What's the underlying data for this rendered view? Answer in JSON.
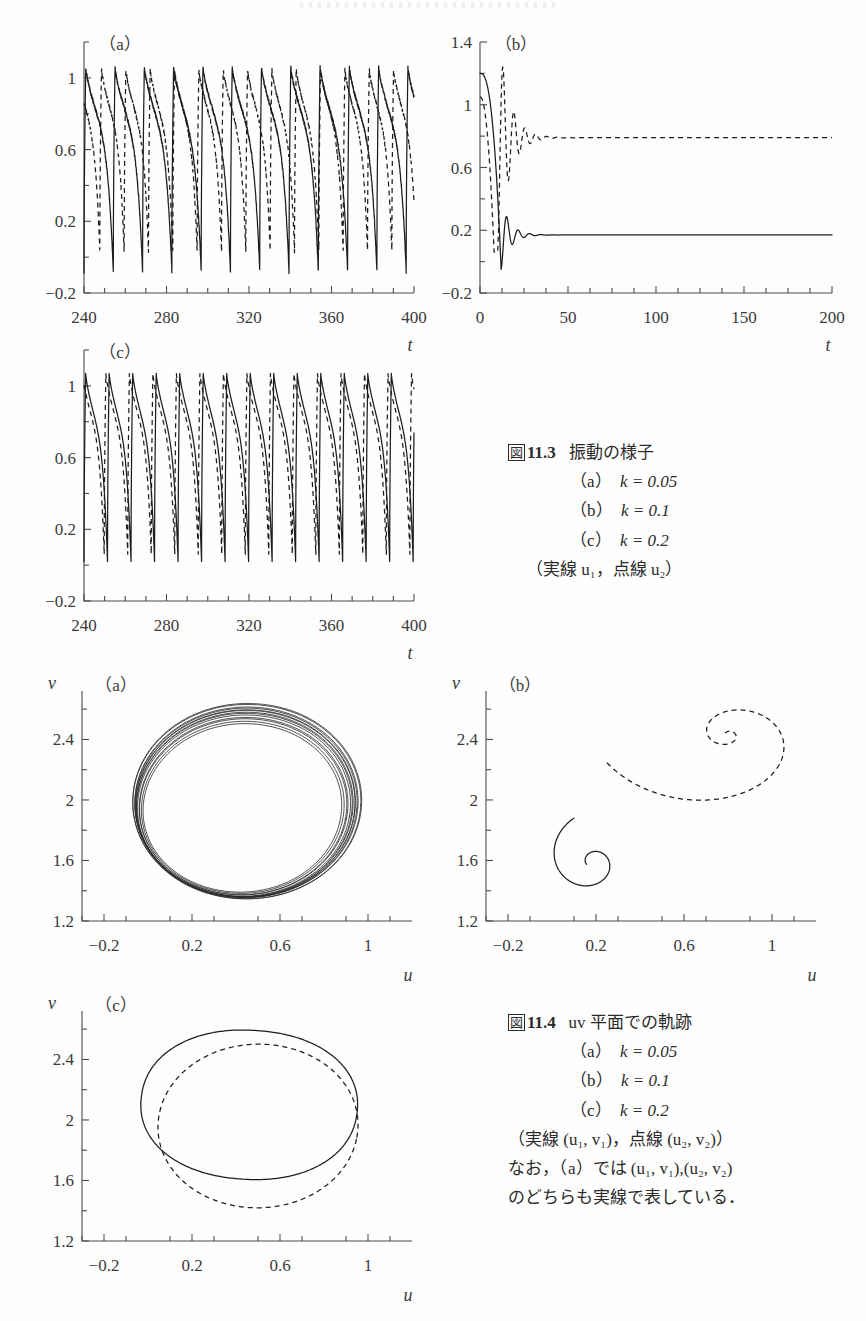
{
  "page": {
    "width": 866,
    "height": 1321,
    "background": "#fefefe",
    "ink": "#1d1d1d"
  },
  "figures": [
    {
      "id": "fig-11-3",
      "caption": {
        "number": "11.3",
        "fig_word": "図",
        "title": "振動の様子",
        "items": [
          {
            "tag": "（a）",
            "text": "k = 0.05"
          },
          {
            "tag": "（b）",
            "text": "k = 0.1"
          },
          {
            "tag": "（c）",
            "text": "k = 0.2"
          }
        ],
        "note": "（実線 u₁，点線 u₂）"
      }
    },
    {
      "id": "fig-11-4",
      "caption": {
        "number": "11.4",
        "fig_word": "図",
        "title": "uv 平面での軌跡",
        "items": [
          {
            "tag": "（a）",
            "text": "k = 0.05"
          },
          {
            "tag": "（b）",
            "text": "k = 0.1"
          },
          {
            "tag": "（c）",
            "text": "k = 0.2"
          }
        ],
        "note": "（実線 (u₁, v₁)，点線 (u₂, v₂)）",
        "note2": "なお，（a）では (u₁, v₁),(u₂, v₂)",
        "note3": "のどちらも実線で表している．"
      }
    }
  ],
  "chart_data": [
    {
      "id": "fig113a",
      "type": "line",
      "panel_tag": "（a）",
      "title": "",
      "xlabel": "t",
      "ylabel": "",
      "xlim": [
        240,
        400
      ],
      "ylim": [
        -0.2,
        1.2
      ],
      "xticks": [
        240,
        280,
        320,
        360,
        400
      ],
      "xtick_labels": [
        "240",
        "280",
        "320",
        "360",
        "400"
      ],
      "yticks": [
        -0.2,
        0.2,
        0.6,
        1.0
      ],
      "ytick_labels": [
        "-0.2",
        "0.2",
        "0.6",
        "1"
      ],
      "minor_x_step": 10,
      "minor_y_step": 0.2,
      "grid": false,
      "legend": false,
      "series": [
        {
          "name": "u1",
          "style": "solid",
          "kind": "relaxation",
          "period": 14.2,
          "phase": 0.0,
          "high": 1.06,
          "low": -0.08,
          "rise_frac": 0.06,
          "jitter": 0.02
        },
        {
          "name": "u2",
          "style": "dashed",
          "kind": "relaxation",
          "period": 11.8,
          "phase": 0.35,
          "high": 1.05,
          "low": 0.03,
          "rise_frac": 0.07,
          "jitter": 0.02
        }
      ]
    },
    {
      "id": "fig113b",
      "type": "line",
      "panel_tag": "（b）",
      "title": "",
      "xlabel": "t",
      "ylabel": "",
      "xlim": [
        0,
        200
      ],
      "ylim": [
        -0.2,
        1.4
      ],
      "xticks": [
        0,
        50,
        100,
        150,
        200
      ],
      "xtick_labels": [
        "0",
        "50",
        "100",
        "150",
        "200"
      ],
      "yticks": [
        -0.2,
        0.2,
        0.6,
        1.0,
        1.4
      ],
      "ytick_labels": [
        "-0.2",
        "0.2",
        "0.6",
        "1",
        "1.4"
      ],
      "minor_x_step": 12.5,
      "minor_y_step": 0.2,
      "grid": false,
      "legend": false,
      "series": [
        {
          "name": "u1",
          "style": "solid",
          "kind": "damped",
          "start": 1.2,
          "settle": 0.17,
          "undershoot": -0.05,
          "t_drop": 12.0,
          "decay": 0.2,
          "osc_period": 6.5
        },
        {
          "name": "u2",
          "style": "dashed",
          "kind": "damped",
          "start": 1.05,
          "settle": 0.79,
          "undershoot": 0.06,
          "t_drop": 10.0,
          "decay": 0.16,
          "osc_period": 6.2
        }
      ]
    },
    {
      "id": "fig113c",
      "type": "line",
      "panel_tag": "（c）",
      "title": "",
      "xlabel": "t",
      "ylabel": "",
      "xlim": [
        240,
        400
      ],
      "ylim": [
        -0.2,
        1.2
      ],
      "xticks": [
        240,
        280,
        320,
        360,
        400
      ],
      "xtick_labels": [
        "240",
        "280",
        "320",
        "360",
        "400"
      ],
      "yticks": [
        -0.2,
        0.2,
        0.6,
        1.0
      ],
      "ytick_labels": [
        "-0.2",
        "0.2",
        "0.6",
        "1"
      ],
      "minor_x_step": 10,
      "minor_y_step": 0.2,
      "grid": false,
      "legend": false,
      "series": [
        {
          "name": "u1",
          "style": "solid",
          "kind": "relaxation",
          "period": 11.4,
          "phase": 0.0,
          "high": 1.07,
          "low": 0.02,
          "rise_frac": 0.07,
          "jitter": 0.0
        },
        {
          "name": "u2",
          "style": "dashed",
          "kind": "relaxation",
          "period": 11.4,
          "phase": 0.14,
          "high": 1.07,
          "low": 0.06,
          "rise_frac": 0.07,
          "jitter": 0.0
        }
      ]
    },
    {
      "id": "fig114a",
      "type": "line",
      "panel_tag": "（a）",
      "title": "",
      "xlabel": "u",
      "ylabel": "v",
      "xlim": [
        -0.3,
        1.2
      ],
      "ylim": [
        1.2,
        2.72
      ],
      "xticks": [
        -0.2,
        0.2,
        0.6,
        1.0
      ],
      "xtick_labels": [
        "-0.2",
        "0.2",
        "0.6",
        "1"
      ],
      "yticks": [
        1.2,
        1.6,
        2.0,
        2.4
      ],
      "ytick_labels": [
        "1.2",
        "1.6",
        "2",
        "2.4"
      ],
      "minor_x_step": 0.2,
      "minor_y_step": 0.2,
      "grid": false,
      "legend": false,
      "series": [
        {
          "name": "orbit-bundle",
          "style": "thin",
          "kind": "loopbundle",
          "count": 13,
          "cx": 0.44,
          "cy": 1.97,
          "rx": 0.5,
          "ry": 0.62,
          "squareness": 0.3,
          "tilt": -0.22,
          "spread": 0.085
        }
      ]
    },
    {
      "id": "fig114b",
      "type": "line",
      "panel_tag": "（b）",
      "title": "",
      "xlabel": "u",
      "ylabel": "v",
      "xlim": [
        -0.3,
        1.2
      ],
      "ylim": [
        1.2,
        2.72
      ],
      "xticks": [
        -0.2,
        0.2,
        0.6,
        1.0
      ],
      "xtick_labels": [
        "-0.2",
        "0.2",
        "0.6",
        "1"
      ],
      "yticks": [
        1.2,
        1.6,
        2.0,
        2.4
      ],
      "ytick_labels": [
        "1.2",
        "1.6",
        "2",
        "2.4"
      ],
      "minor_x_step": 0.2,
      "minor_y_step": 0.2,
      "grid": false,
      "legend": false,
      "series": [
        {
          "name": "(u1,v1)",
          "style": "solid",
          "kind": "spiral",
          "fx": 0.185,
          "fy": 1.59,
          "r0": 0.42,
          "a0": 1.95,
          "turns": 1.25,
          "shrink": 0.055,
          "yscale": 1.35
        },
        {
          "name": "(u2,v2)",
          "style": "dashed",
          "kind": "spiral",
          "fx": 0.8,
          "fy": 2.43,
          "r0": 1.05,
          "a0": 3.45,
          "turns": 1.85,
          "shrink": 0.03,
          "yscale": 1.05
        }
      ]
    },
    {
      "id": "fig114c",
      "type": "line",
      "panel_tag": "（c）",
      "title": "",
      "xlabel": "u",
      "ylabel": "v",
      "xlim": [
        -0.3,
        1.2
      ],
      "ylim": [
        1.2,
        2.72
      ],
      "xticks": [
        -0.2,
        0.2,
        0.6,
        1.0
      ],
      "xtick_labels": [
        "-0.2",
        "0.2",
        "0.6",
        "1"
      ],
      "yticks": [
        1.2,
        1.6,
        2.0,
        2.4
      ],
      "ytick_labels": [
        "1.2",
        "1.6",
        "2",
        "2.4"
      ],
      "minor_x_step": 0.2,
      "minor_y_step": 0.2,
      "grid": false,
      "legend": false,
      "series": [
        {
          "name": "(u1,v1)",
          "style": "solid",
          "kind": "loop",
          "cx": 0.46,
          "cy": 2.1,
          "rx": 0.5,
          "ry": 0.5,
          "squareness": 0.34,
          "tilt": -0.2
        },
        {
          "name": "(u2,v2)",
          "style": "dashed",
          "kind": "loop",
          "cx": 0.5,
          "cy": 1.96,
          "rx": 0.47,
          "ry": 0.56,
          "squareness": 0.3,
          "tilt": -0.3
        }
      ]
    }
  ]
}
